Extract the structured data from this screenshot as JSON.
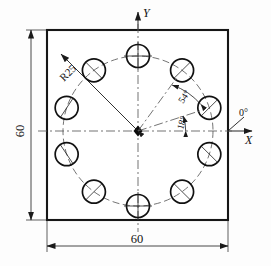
{
  "drawing": {
    "title": "Bolt circle hole pattern plate",
    "axes": {
      "y_label": "Y",
      "x_label": "X",
      "zero_label": "0°"
    },
    "dimensions": {
      "width_label": "60",
      "height_label": "60",
      "radius_label": "R25"
    },
    "angles": {
      "first_hole_label": "18°",
      "second_hole_label": "54°"
    },
    "plate": {
      "x": 47,
      "y": 30,
      "width": 181,
      "height": 190,
      "stroke": "#161616"
    },
    "bolt_circle": {
      "center_x": 138,
      "center_y": 131,
      "radius": 75,
      "hole_radius": 11.5,
      "hole_count": 10,
      "start_angle_deg": 18,
      "step_angle_deg": 36,
      "stroke": "#5a5a5a"
    },
    "holes": [
      {
        "index": 1,
        "angle_deg": 18
      },
      {
        "index": 2,
        "angle_deg": 54
      },
      {
        "index": 3,
        "angle_deg": 90
      },
      {
        "index": 4,
        "angle_deg": 126
      },
      {
        "index": 5,
        "angle_deg": 162
      },
      {
        "index": 6,
        "angle_deg": 198
      },
      {
        "index": 7,
        "angle_deg": 234
      },
      {
        "index": 8,
        "angle_deg": 270
      },
      {
        "index": 9,
        "angle_deg": 306
      },
      {
        "index": 10,
        "angle_deg": 342
      }
    ],
    "colors": {
      "ink": "#161616",
      "thin_ink": "#1a1a1a",
      "construction": "#5a5a5a",
      "paper": "#fdfdfd"
    }
  }
}
